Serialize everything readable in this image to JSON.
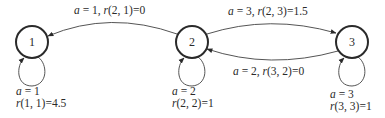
{
  "diagram": {
    "type": "markov-decision-process-state-graph",
    "nodes": [
      {
        "id": "1",
        "label": "1"
      },
      {
        "id": "2",
        "label": "2"
      },
      {
        "id": "3",
        "label": "3"
      }
    ],
    "edges": [
      {
        "from": "2",
        "to": "1",
        "action": "a = 1",
        "reward": "r(2, 1)=0",
        "label": "a = 1, r(2, 1)=0"
      },
      {
        "from": "2",
        "to": "3",
        "action": "a = 3",
        "reward": "r(2, 3)=1.5",
        "label": "a = 3, r(2, 3)=1.5"
      },
      {
        "from": "3",
        "to": "2",
        "action": "a = 2",
        "reward": "r(3, 2)=0",
        "label": "a = 2, r(3, 2)=0"
      },
      {
        "from": "1",
        "to": "1",
        "action": "a = 1",
        "reward": "r(1, 1)=4.5"
      },
      {
        "from": "2",
        "to": "2",
        "action": "a = 2",
        "reward": "r(2, 2)=1"
      },
      {
        "from": "3",
        "to": "3",
        "action": "a = 3",
        "reward": "r(3, 3)=1"
      }
    ]
  },
  "labels": {
    "e21": {
      "a": "a",
      "rest": " = 1, ",
      "r": "r",
      "tail": "(2, 1)=0"
    },
    "e23": {
      "a": "a",
      "rest": " = 3, ",
      "r": "r",
      "tail": "(2, 3)=1.5"
    },
    "e32": {
      "a": "a",
      "rest": " = 2, ",
      "r": "r",
      "tail": "(3, 2)=0"
    },
    "l1": {
      "a": "a",
      "rest": " = 1",
      "r": "r",
      "tail": "(1, 1)=4.5"
    },
    "l2": {
      "a": "a",
      "rest": " = 2",
      "r": "r",
      "tail": "(2, 2)=1"
    },
    "l3": {
      "a": "a",
      "rest": " = 3",
      "r": "r",
      "tail": "(3, 3)=1"
    }
  }
}
